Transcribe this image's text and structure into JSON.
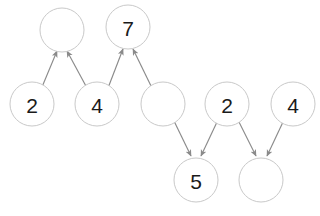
{
  "diagram": {
    "type": "directed-graph",
    "background_color": "#ffffff",
    "node_stroke_color": "#c9c9c9",
    "node_fill_color": "#ffffff",
    "edge_color": "#8a8a8a",
    "label_color": "#1a1a1a",
    "node_radius": 22,
    "nodes": [
      {
        "id": "n-top-left",
        "label": "",
        "cx": 62,
        "cy": 30,
        "row": "top",
        "empty": true
      },
      {
        "id": "n-top-seven",
        "label": "7",
        "cx": 128,
        "cy": 27,
        "row": "top",
        "empty": false
      },
      {
        "id": "n-mid-two-a",
        "label": "2",
        "cx": 32,
        "cy": 104,
        "row": "middle",
        "empty": false
      },
      {
        "id": "n-mid-four-a",
        "label": "4",
        "cx": 97,
        "cy": 104,
        "row": "middle",
        "empty": false
      },
      {
        "id": "n-mid-empty",
        "label": "",
        "cx": 163,
        "cy": 104,
        "row": "middle",
        "empty": true
      },
      {
        "id": "n-mid-two-b",
        "label": "2",
        "cx": 227,
        "cy": 104,
        "row": "middle",
        "empty": false
      },
      {
        "id": "n-mid-four-b",
        "label": "4",
        "cx": 293,
        "cy": 104,
        "row": "middle",
        "empty": false
      },
      {
        "id": "n-bot-five",
        "label": "5",
        "cx": 196,
        "cy": 180,
        "row": "bottom",
        "empty": false
      },
      {
        "id": "n-bot-empty",
        "label": "",
        "cx": 261,
        "cy": 180,
        "row": "bottom",
        "empty": true
      }
    ],
    "edges": [
      {
        "id": "e-1",
        "from": "n-mid-two-a",
        "to": "n-top-left",
        "direction": "up",
        "x1": 42,
        "y1": 87,
        "x2": 57,
        "y2": 51
      },
      {
        "id": "e-2",
        "from": "n-mid-four-a",
        "to": "n-top-left",
        "direction": "up",
        "x1": 87,
        "y1": 88,
        "x2": 67,
        "y2": 51
      },
      {
        "id": "e-3",
        "from": "n-mid-four-a",
        "to": "n-top-seven",
        "direction": "up",
        "x1": 108,
        "y1": 88,
        "x2": 123,
        "y2": 49
      },
      {
        "id": "e-4",
        "from": "n-mid-empty",
        "to": "n-top-seven",
        "direction": "up",
        "x1": 152,
        "y1": 88,
        "x2": 133,
        "y2": 49
      },
      {
        "id": "e-5",
        "from": "n-mid-empty",
        "to": "n-bot-five",
        "direction": "down",
        "x1": 174,
        "y1": 121,
        "x2": 191,
        "y2": 156
      },
      {
        "id": "e-6",
        "from": "n-mid-two-b",
        "to": "n-bot-five",
        "direction": "down",
        "x1": 217,
        "y1": 122,
        "x2": 201,
        "y2": 156
      },
      {
        "id": "e-7",
        "from": "n-mid-two-b",
        "to": "n-bot-empty",
        "direction": "down",
        "x1": 239,
        "y1": 122,
        "x2": 256,
        "y2": 156
      },
      {
        "id": "e-8",
        "from": "n-mid-four-b",
        "to": "n-bot-empty",
        "direction": "down",
        "x1": 283,
        "y1": 122,
        "x2": 267,
        "y2": 156
      }
    ]
  }
}
